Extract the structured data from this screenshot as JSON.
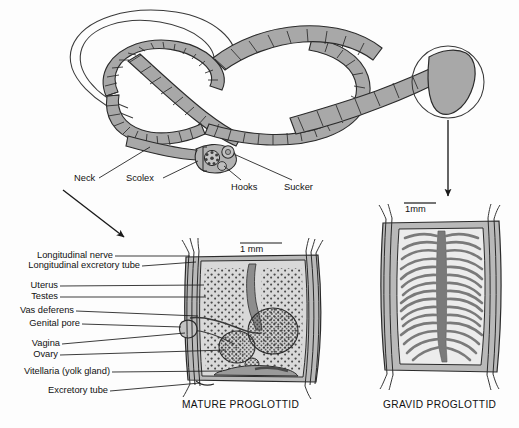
{
  "figure": {
    "background_color": "#fdfdfd",
    "ink_color": "#1a1a1a",
    "body_fill": "#a8a8a8",
    "proglottid_fill": "#b9b9b9",
    "interior_fill": "#d9d9d9",
    "organ_fill": "#555555",
    "uterus_fill": "#6e6e6e"
  },
  "whole_worm": {
    "labels": [
      {
        "id": "neck",
        "text": "Neck"
      },
      {
        "id": "scolex",
        "text": "Scolex"
      },
      {
        "id": "hooks",
        "text": "Hooks"
      },
      {
        "id": "sucker",
        "text": "Sucker"
      }
    ]
  },
  "mature_proglottid": {
    "caption": "MATURE PROGLOTTID",
    "scale_bar": "1 mm",
    "labels": [
      {
        "id": "longitudinal-nerve",
        "text": "Longitudinal nerve"
      },
      {
        "id": "longitudinal-excretory-tube",
        "text": "Longitudinal excretory tube"
      },
      {
        "id": "uterus",
        "text": "Uterus"
      },
      {
        "id": "testes",
        "text": "Testes"
      },
      {
        "id": "vas-deferens",
        "text": "Vas deferens"
      },
      {
        "id": "genital-pore",
        "text": "Genital pore"
      },
      {
        "id": "vagina",
        "text": "Vagina"
      },
      {
        "id": "ovary",
        "text": "Ovary"
      },
      {
        "id": "vitellaria",
        "text": "Vitellaria (yolk gland)"
      },
      {
        "id": "excretory-tube",
        "text": "Excretory tube"
      }
    ]
  },
  "gravid_proglottid": {
    "caption": "GRAVID PROGLOTTID",
    "scale_bar": "1mm"
  }
}
